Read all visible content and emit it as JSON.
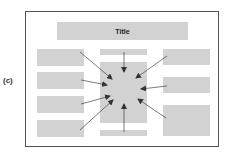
{
  "panel_label": "(c)",
  "diagram": {
    "title": "Title",
    "colors": {
      "box": "#d2d2d2",
      "frame_border": "#555555",
      "arrow": "#333333"
    },
    "left_boxes": 4,
    "right_boxes": 3,
    "center": {
      "top_bar": true,
      "main_box": true,
      "bottom_bar": true
    },
    "arrows_point_to": "center"
  }
}
